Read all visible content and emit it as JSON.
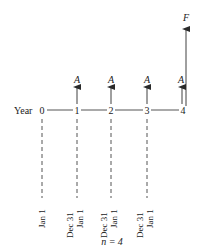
{
  "diagram": {
    "type": "cash-flow-timeline",
    "axis_label": "Year",
    "years": [
      {
        "label": "0",
        "x": 42
      },
      {
        "label": "1",
        "x": 77
      },
      {
        "label": "2",
        "x": 111
      },
      {
        "label": "3",
        "x": 147
      },
      {
        "label": "4",
        "x": 183
      }
    ],
    "annuity_label": "A",
    "future_value_label": "F",
    "date_markers": [
      {
        "x": 42,
        "labels": [
          "Jan 1"
        ]
      },
      {
        "x": 77,
        "labels": [
          "Dec 31",
          "Jan 1"
        ]
      },
      {
        "x": 111,
        "labels": [
          "Dec 31",
          "Jan 1"
        ]
      },
      {
        "x": 147,
        "labels": [
          "Dec 31",
          "Jan 1"
        ]
      }
    ],
    "caption": "n = 4",
    "colors": {
      "line": "#2a2a2a",
      "text": "#1a1a1a",
      "background": "#ffffff"
    }
  }
}
